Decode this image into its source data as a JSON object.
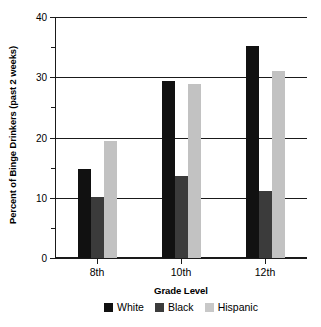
{
  "chart_data": {
    "type": "bar",
    "title": "",
    "xlabel": "Grade Level",
    "ylabel": "Percent of Binge Drinkers (past 2 weeks)",
    "categories": [
      "8th",
      "10th",
      "12th"
    ],
    "series": [
      {
        "name": "White",
        "color": "#111111",
        "values": [
          14.7,
          29.4,
          35.2
        ]
      },
      {
        "name": "Black",
        "color": "#3b3b3b",
        "values": [
          10.1,
          13.6,
          11.2
        ]
      },
      {
        "name": "Hispanic",
        "color": "#c2c2c2",
        "values": [
          19.4,
          28.8,
          31.0
        ]
      }
    ],
    "ylim": [
      0,
      40
    ],
    "y_major_ticks": [
      0,
      10,
      20,
      30,
      40
    ],
    "y_minor_ticks": [
      5,
      15,
      25,
      35
    ],
    "y_tick_labels": [
      "0",
      "10",
      "20",
      "30",
      "40"
    ],
    "grid": "horizontal-major",
    "legend_position": "bottom"
  },
  "axis": {
    "y_labels": [
      "0",
      "10",
      "20",
      "30",
      "40"
    ],
    "x_labels": [
      "8th",
      "10th",
      "12th"
    ],
    "y_title": "Percent of Binge Drinkers (past 2 weeks)",
    "x_title": "Grade Level"
  },
  "legend": {
    "items": [
      {
        "label": "White"
      },
      {
        "label": "Black"
      },
      {
        "label": "Hispanic"
      }
    ]
  }
}
